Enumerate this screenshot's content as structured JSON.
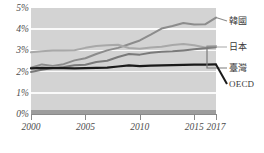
{
  "chart_data": {
    "type": "line",
    "title": "",
    "subtitle": "",
    "xlabel": "",
    "ylabel": "",
    "x": [
      2000,
      2001,
      2002,
      2003,
      2004,
      2005,
      2006,
      2007,
      2008,
      2009,
      2010,
      2011,
      2012,
      2013,
      2014,
      2015,
      2016,
      2017
    ],
    "xlim": [
      2000,
      2017
    ],
    "ylim": [
      0,
      5
    ],
    "grid": true,
    "legend_position": "right-end-labels",
    "y_tick_labels": [
      "5%",
      "4%",
      "3%",
      "2%",
      "1%",
      "0%"
    ],
    "y_tick_values": [
      5,
      4,
      3,
      2,
      1,
      0
    ],
    "x_tick_labels": [
      "2000",
      "2005",
      "2010",
      "2015",
      "2017"
    ],
    "x_tick_values": [
      2000,
      2005,
      2010,
      2015,
      2017
    ],
    "series": [
      {
        "name": "韓國",
        "label": "韓國",
        "color": "#8c8c8c",
        "values": [
          2.18,
          2.34,
          2.27,
          2.35,
          2.53,
          2.63,
          2.83,
          3.0,
          3.12,
          3.29,
          3.47,
          3.74,
          4.03,
          4.15,
          4.29,
          4.22,
          4.23,
          4.55
        ]
      },
      {
        "name": "日本",
        "label": "日本",
        "color": "#a8a8a8",
        "values": [
          2.91,
          2.96,
          2.99,
          3.0,
          3.01,
          3.12,
          3.21,
          3.24,
          3.27,
          3.11,
          3.08,
          3.14,
          3.17,
          3.25,
          3.3,
          3.24,
          3.14,
          3.21
        ]
      },
      {
        "name": "臺灣",
        "label": "臺灣",
        "color": "#7a7a7a",
        "values": [
          1.98,
          2.09,
          2.17,
          2.22,
          2.3,
          2.32,
          2.45,
          2.51,
          2.69,
          2.83,
          2.8,
          2.89,
          2.94,
          2.96,
          3.0,
          3.05,
          3.1,
          3.15
        ]
      },
      {
        "name": "OECD",
        "label": "OECD",
        "color": "#1a1a1a",
        "values": [
          2.15,
          2.18,
          2.16,
          2.16,
          2.15,
          2.16,
          2.18,
          2.19,
          2.24,
          2.29,
          2.26,
          2.28,
          2.29,
          2.31,
          2.32,
          2.33,
          2.33,
          2.34
        ]
      }
    ],
    "annotations": []
  },
  "axis": {
    "y_ticks": [
      {
        "label": "5%",
        "value": 5
      },
      {
        "label": "4%",
        "value": 4
      },
      {
        "label": "3%",
        "value": 3
      },
      {
        "label": "2%",
        "value": 2
      },
      {
        "label": "1%",
        "value": 1
      },
      {
        "label": "0%",
        "value": 0
      }
    ],
    "x_ticks": [
      {
        "label": "2000",
        "value": 2000
      },
      {
        "label": "2005",
        "value": 2005
      },
      {
        "label": "2010",
        "value": 2010
      },
      {
        "label": "2015",
        "value": 2015
      },
      {
        "label": "2017",
        "value": 2017
      }
    ]
  },
  "colors": {
    "plot_background": "#d3d3d3",
    "gridline": "#fafafa",
    "axis": "#8a8a8a",
    "baseline_band": "#9d9d9d",
    "tick_text": "#4c4c4c",
    "label_text": "#3a3a3a"
  }
}
